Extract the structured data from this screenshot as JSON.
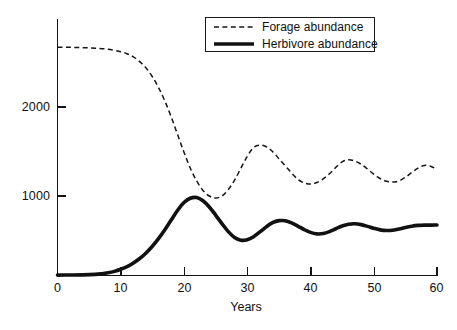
{
  "chart_data": {
    "type": "line",
    "title": "",
    "subtitle": "",
    "xlabel": "Years",
    "ylabel": "",
    "xlim": [
      0,
      60
    ],
    "ylim": [
      0,
      2900
    ],
    "grid": false,
    "legend_position": "top-right",
    "xticks": [
      0,
      10,
      20,
      30,
      40,
      50,
      60
    ],
    "xtick_labels": [
      "0",
      "10",
      "20",
      "30",
      "40",
      "50",
      "60"
    ],
    "yticks": [
      1000,
      2000
    ],
    "ytick_labels": [
      "1000",
      "2000"
    ],
    "line_color": "#151515",
    "series": [
      {
        "name": "Forage abundance",
        "style": "dashed",
        "x": [
          0,
          2,
          4,
          6,
          8,
          10,
          11,
          12,
          13,
          14,
          15,
          16,
          17,
          18,
          19,
          20,
          21,
          22,
          23,
          24,
          25,
          26,
          27,
          28,
          29,
          30,
          31,
          32,
          33,
          34,
          35,
          36,
          37,
          38,
          39,
          40,
          41,
          42,
          43,
          44,
          45,
          46,
          47,
          48,
          49,
          50,
          51,
          52,
          53,
          54,
          55,
          56,
          57,
          58,
          59,
          60
        ],
        "values": [
          2870,
          2870,
          2865,
          2860,
          2845,
          2815,
          2790,
          2750,
          2690,
          2610,
          2500,
          2360,
          2190,
          1990,
          1770,
          1550,
          1350,
          1190,
          1070,
          1000,
          975,
          1000,
          1080,
          1200,
          1350,
          1500,
          1610,
          1640,
          1620,
          1560,
          1470,
          1380,
          1290,
          1210,
          1165,
          1150,
          1170,
          1215,
          1280,
          1360,
          1430,
          1455,
          1440,
          1400,
          1340,
          1275,
          1220,
          1185,
          1175,
          1190,
          1235,
          1295,
          1350,
          1385,
          1375,
          1330
        ]
      },
      {
        "name": "Herbivore abundance",
        "style": "solid",
        "x": [
          0,
          2,
          4,
          6,
          7,
          8,
          9,
          10,
          11,
          12,
          13,
          14,
          15,
          16,
          17,
          18,
          19,
          20,
          21,
          22,
          23,
          24,
          25,
          26,
          27,
          28,
          29,
          30,
          31,
          32,
          33,
          34,
          35,
          36,
          37,
          38,
          39,
          40,
          41,
          42,
          43,
          44,
          45,
          46,
          47,
          48,
          49,
          50,
          51,
          52,
          53,
          54,
          55,
          56,
          57,
          58,
          59,
          60
        ],
        "values": [
          5,
          6,
          8,
          14,
          22,
          34,
          52,
          78,
          112,
          158,
          214,
          284,
          368,
          466,
          578,
          700,
          820,
          918,
          972,
          980,
          940,
          862,
          760,
          652,
          552,
          478,
          444,
          450,
          488,
          548,
          612,
          664,
          690,
          688,
          662,
          622,
          578,
          542,
          524,
          528,
          552,
          588,
          622,
          644,
          650,
          640,
          618,
          594,
          574,
          566,
          570,
          584,
          604,
          620,
          630,
          634,
          634,
          636
        ]
      }
    ],
    "annotations": []
  },
  "legend": {
    "items": [
      {
        "label": "Forage abundance",
        "style": "dashed"
      },
      {
        "label": "Herbivore abundance",
        "style": "solid"
      }
    ]
  },
  "axes": {
    "x_title": "Years"
  }
}
